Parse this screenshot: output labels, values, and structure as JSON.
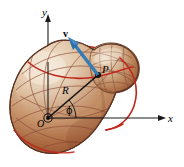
{
  "figure": {
    "kind": "physics-vector-diagram",
    "background_color": "#ffffff"
  },
  "axes": {
    "y_label": "y",
    "x_label": "x",
    "origin_label": "O",
    "axis_color": "#1a1a1a"
  },
  "labels": {
    "point_label": "P",
    "radius_label": "R",
    "angle_label": "ϕ",
    "vector_label": "v"
  },
  "colors": {
    "axis": "#1a1a1a",
    "vector_blue": "#2f6fa8",
    "vector_blue_dark": "#1f5586",
    "rotation_curve_red": "#c0271c",
    "mesh_line": "#8a4a33",
    "body_highlight": "#efe4d6",
    "body_light": "#ddc4ab",
    "body_mid": "#c08a62",
    "body_dark": "#9a5533",
    "body_darkest": "#7e4026",
    "body_outline": "#5d3220"
  },
  "geometry": {
    "origin": {
      "x": 48,
      "y": 118
    },
    "point_p": {
      "x": 98,
      "y": 75
    },
    "vector_tip": {
      "x": 69,
      "y": 38
    },
    "x_axis_end": {
      "x": 165,
      "y": 118
    },
    "y_axis_top": {
      "x": 48,
      "y": 16
    },
    "angle_phi_degrees": 41
  },
  "elements": [
    {
      "name": "irregular-body",
      "description": "pear/gourd shaped shaded solid with mesh grid"
    },
    {
      "name": "radius-vector",
      "description": "line from O to P labeled R"
    },
    {
      "name": "velocity-vector",
      "description": "blue arrow at P labeled v"
    },
    {
      "name": "rotation-curve-top",
      "description": "red arc across top of body"
    },
    {
      "name": "rotation-curve-right",
      "description": "red arc down right side of body"
    },
    {
      "name": "angle-arc",
      "description": "small arc between x-axis and R labeled phi"
    }
  ]
}
